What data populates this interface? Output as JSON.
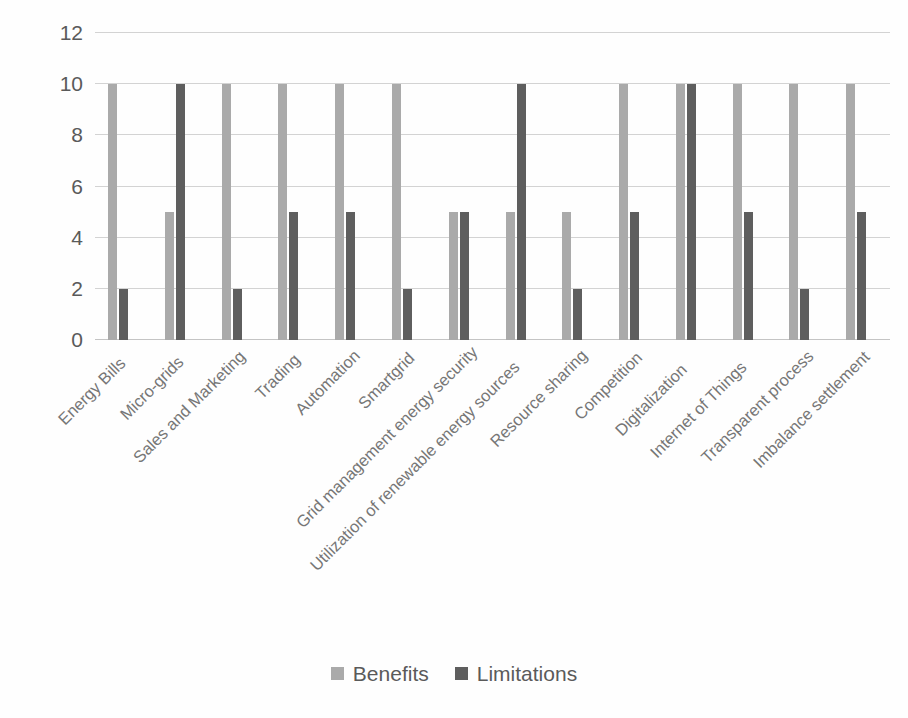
{
  "chart_data": {
    "type": "bar",
    "title": "",
    "subtitle": "",
    "xlabel": "",
    "ylabel": "",
    "ylim": [
      0,
      12
    ],
    "ytick_step": 2,
    "yticks": [
      12,
      10,
      8,
      6,
      4,
      2,
      0
    ],
    "grid": true,
    "legend_position": "bottom-center",
    "categories": [
      "Energy Bills",
      "Micro-grids",
      "Sales and Marketing",
      "Trading",
      "Automation",
      "Smartgrid",
      "Grid management energy security",
      "Utilization of renewable energy sources",
      "Resource sharing",
      "Competition",
      "Digitalization",
      "Internet of Things",
      "Transparent process",
      "Imbalance settlement"
    ],
    "series": [
      {
        "name": "Benefits",
        "color": "#aaaaaa",
        "values": [
          10,
          5,
          10,
          10,
          10,
          10,
          5,
          5,
          5,
          10,
          10,
          10,
          10,
          10
        ]
      },
      {
        "name": "Limitations",
        "color": "#5e5e5e",
        "values": [
          2,
          10,
          2,
          5,
          5,
          2,
          5,
          10,
          2,
          5,
          10,
          5,
          2,
          5
        ]
      }
    ]
  },
  "legend": {
    "items": [
      {
        "label": "Benefits",
        "color": "#aaaaaa"
      },
      {
        "label": "Limitations",
        "color": "#5e5e5e"
      }
    ]
  },
  "colors": {
    "benefits": "#aaaaaa",
    "limitations": "#5e5e5e",
    "gridline": "#d3d3d3",
    "tick_text": "#5a5a5a",
    "category_text": "#767676",
    "background": "#fefefe"
  }
}
